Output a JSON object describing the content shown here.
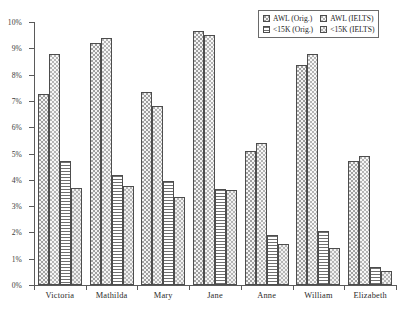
{
  "chart_data": {
    "type": "bar",
    "title": "",
    "xlabel": "",
    "ylabel": "",
    "ylim": [
      0,
      10
    ],
    "ytick_labels": [
      "0%",
      "1%",
      "2%",
      "3%",
      "4%",
      "5%",
      "6%",
      "7%",
      "8%",
      "9%",
      "10%"
    ],
    "ytick_values": [
      0,
      1,
      2,
      3,
      4,
      5,
      6,
      7,
      8,
      9,
      10
    ],
    "grid": false,
    "legend_position": "top-right",
    "categories": [
      "Victoria",
      "Mathilda",
      "Mary",
      "Jane",
      "Anne",
      "William",
      "Elizabeth"
    ],
    "series": [
      {
        "name": "AWL (Orig.)",
        "pattern": "dots",
        "values": [
          7.25,
          9.2,
          7.35,
          9.65,
          5.1,
          8.35,
          4.7
        ]
      },
      {
        "name": "AWL (IELTS)",
        "pattern": "dots-light",
        "values": [
          8.8,
          9.4,
          6.8,
          9.5,
          5.4,
          8.8,
          4.9
        ]
      },
      {
        "name": "<15K (Orig.)",
        "pattern": "horizontal-lines",
        "values": [
          4.7,
          4.2,
          3.95,
          3.65,
          1.9,
          2.05,
          0.7
        ]
      },
      {
        "name": "<15K (IELTS)",
        "pattern": "checker",
        "values": [
          3.7,
          3.75,
          3.35,
          3.6,
          1.55,
          1.4,
          0.55
        ]
      }
    ]
  },
  "legend": {
    "entries": [
      {
        "label": "AWL (Orig.)"
      },
      {
        "label": "AWL (IELTS)"
      },
      {
        "label": "<15K (Orig.)"
      },
      {
        "label": "<15K (IELTS)"
      }
    ]
  },
  "colors": {
    "axis": "#5a5a5a",
    "bar_outline": "#4d4d4d",
    "background": "#ffffff",
    "text": "#222222"
  }
}
